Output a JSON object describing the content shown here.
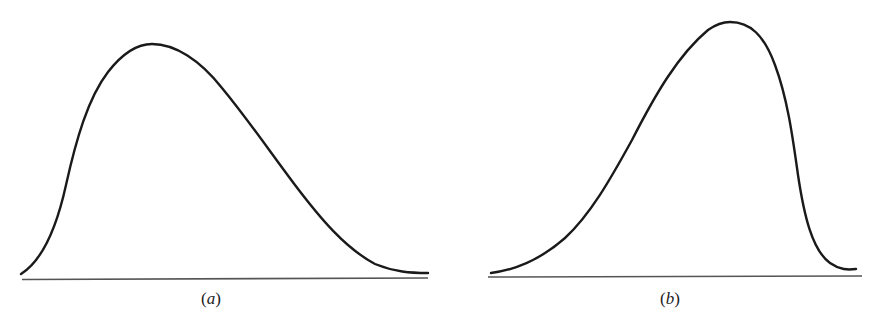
{
  "figures": [
    {
      "id": "a",
      "label": "(a)",
      "label_letter": "a",
      "description": "Right-skewed (positively skewed) distribution curve",
      "skew": "right"
    },
    {
      "id": "b",
      "label": "(b)",
      "label_letter": "b",
      "description": "Left-skewed (negatively skewed) distribution curve",
      "skew": "left"
    }
  ],
  "colors": {
    "curve": "#1a1a1a",
    "baseline": "#555555",
    "background": "#ffffff"
  }
}
